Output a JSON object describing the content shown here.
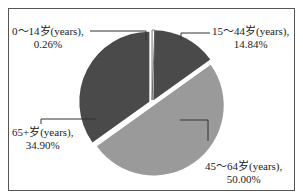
{
  "chart_data": {
    "type": "pie",
    "title": "",
    "categories": [
      "0~14岁(years)",
      "15~44岁(years)",
      "45~64岁(years)",
      "65+岁(years)"
    ],
    "values": [
      0.26,
      14.84,
      50.0,
      34.9
    ],
    "unit": "%",
    "colors": [
      "#ffffff",
      "#4a4a4a",
      "#9a9a9a",
      "#4a4a4a"
    ],
    "legend": "none",
    "labels": [
      {
        "line1": "0～14岁(years),",
        "line2": "0.26%"
      },
      {
        "line1": "15～44岁(years),",
        "line2": "14.84%"
      },
      {
        "line1": "45～64岁(years),",
        "line2": "50.00%"
      },
      {
        "line1": "65+岁(years),",
        "line2": "34.90%"
      }
    ]
  }
}
